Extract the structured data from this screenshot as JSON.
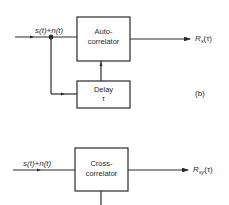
{
  "diagram": {
    "top": {
      "input_label": "s(t)+n(t)",
      "block_main": {
        "line1": "Auto-",
        "line2": "correlator"
      },
      "block_delay": {
        "line1": "Delay",
        "line2": "τ"
      },
      "output_label": {
        "base": "R",
        "sub": "x",
        "arg": "(τ)"
      },
      "panel_label": "(b)"
    },
    "bottom": {
      "input_label": "s(t)+n(t)",
      "block_main": {
        "line1": "Cross-",
        "line2": "correlator"
      },
      "output_label": {
        "base": "R",
        "sub": "xy",
        "arg": "(τ)"
      }
    },
    "colors": {
      "line": "#2a2a2a",
      "background": "#ffffff"
    }
  }
}
